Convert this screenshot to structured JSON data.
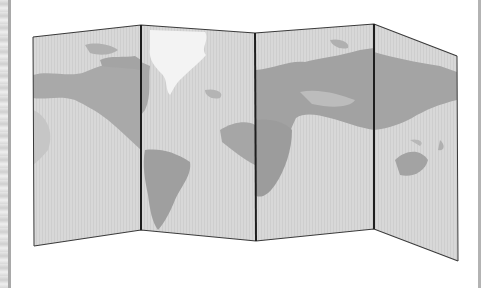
{
  "image": {
    "subject": "folded world map",
    "panels": 4,
    "style": "grayscale",
    "colors": {
      "background": "#ffffff",
      "ocean": "#d6d6d6",
      "land": "#a8a8a8",
      "land_light": "#f2f2f2",
      "fold_line": "#1e1e1e",
      "outline": "#3a3a3a"
    }
  },
  "panels": [
    {
      "name": "panel-1",
      "content": "North America (west), Pacific",
      "points": "33,37 141,25 141,230 34,246"
    },
    {
      "name": "panel-2",
      "content": "Greenland, South America, Atlantic",
      "points": "141,25 255,33 256,241 141,230"
    },
    {
      "name": "panel-3",
      "content": "Europe, Africa, Asia (west), Indian Ocean",
      "points": "255,33 374,24 374,229 256,241"
    },
    {
      "name": "panel-4",
      "content": "East Asia, Australia",
      "points": "374,24 457,56 458,261 374,229"
    }
  ]
}
